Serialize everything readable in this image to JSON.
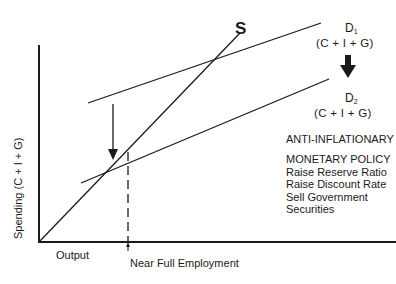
{
  "diagram": {
    "supply_line": {
      "label": "S"
    },
    "demand_lines": [
      {
        "name": "D",
        "subscript": "1",
        "formula": "(C  +  I  +  G)"
      },
      {
        "name": "D",
        "subscript": "2",
        "formula": "(C  +  I  +  G)"
      }
    ],
    "shift_direction": "down",
    "policy": {
      "heading": "ANTI-INFLATIONARY",
      "subheading": "MONETARY POLICY",
      "items": [
        "Raise Reserve Ratio",
        "Raise Discount Rate",
        "Sell Government",
        "Securities"
      ]
    },
    "axes": {
      "y_label": "Spending (C  +  I  +  G)",
      "x_label": "Output"
    },
    "marker": {
      "label": "Near Full Employment"
    },
    "colors": {
      "ink": "#1a1a1a",
      "background": "#ffffff"
    }
  }
}
